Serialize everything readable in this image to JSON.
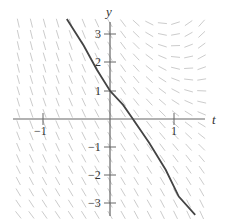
{
  "chart_data": {
    "type": "slope-field",
    "title": "",
    "xlabel": "t",
    "ylabel": "y",
    "xlim": [
      -1.5,
      1.5
    ],
    "ylim": [
      -3.5,
      3.7
    ],
    "x_ticks": [
      {
        "value": -1,
        "label": "−1"
      },
      {
        "value": 1,
        "label": "1"
      }
    ],
    "y_ticks": [
      {
        "value": 3,
        "label": "3"
      },
      {
        "value": 2,
        "label": "2"
      },
      {
        "value": 1,
        "label": "1"
      },
      {
        "value": -1,
        "label": "−1"
      },
      {
        "value": -2,
        "label": "−2"
      },
      {
        "value": -3,
        "label": "−3"
      }
    ],
    "grid": false,
    "legend": null,
    "solution_curve": {
      "description": "Decreasing solution curve passing through (0, 1)",
      "points": [
        [
          -0.66,
          3.55
        ],
        [
          -0.4,
          2.6
        ],
        [
          -0.2,
          1.75
        ],
        [
          0,
          1.0
        ],
        [
          0.2,
          0.5
        ],
        [
          0.35,
          0.0
        ],
        [
          0.6,
          -0.85
        ],
        [
          0.85,
          -1.8
        ],
        [
          1.05,
          -2.75
        ],
        [
          1.3,
          -3.4
        ]
      ],
      "color": "#444444"
    },
    "field_color": "#cccccc",
    "axis_color": "#555555"
  }
}
